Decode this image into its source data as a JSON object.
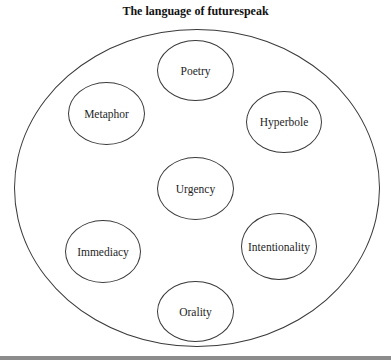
{
  "figure": {
    "title": "The language of futurespeak",
    "container": {
      "shape": "ellipse",
      "label": ""
    },
    "nodes": [
      {
        "id": "poetry",
        "label": "Poetry",
        "position": "top-center"
      },
      {
        "id": "metaphor",
        "label": "Metaphor",
        "position": "upper-left"
      },
      {
        "id": "hyperbole",
        "label": "Hyperbole",
        "position": "upper-right"
      },
      {
        "id": "urgency",
        "label": "Urgency",
        "position": "center"
      },
      {
        "id": "immediacy",
        "label": "Immediacy",
        "position": "lower-left"
      },
      {
        "id": "intentionality",
        "label": "Intentionality",
        "position": "lower-right"
      },
      {
        "id": "orality",
        "label": "Orality",
        "position": "bottom-center"
      }
    ]
  },
  "colors": {
    "stroke": "#3a3a3a",
    "text": "#1e1e1e",
    "background": "#ffffff",
    "bottom_rule": "#8c8c8c"
  }
}
